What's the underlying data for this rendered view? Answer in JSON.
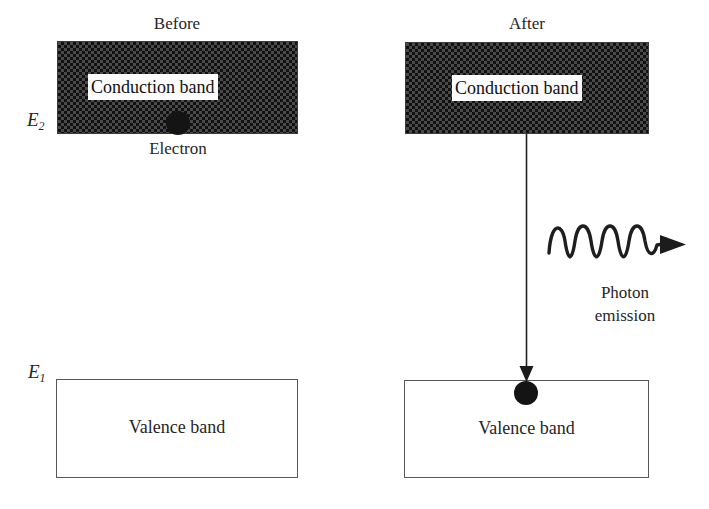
{
  "figure": {
    "topic": "Photon emission from electron transition between conduction and valence band",
    "panels": [
      {
        "id": "before",
        "title": "Before",
        "conduction_band_label": "Conduction band",
        "valence_band_label": "Valence band",
        "energy_label": "E",
        "energy_subscript": "2",
        "electron_caption": "Electron"
      },
      {
        "id": "after",
        "title": "After",
        "conduction_band_label": "Conduction band",
        "valence_band_label": "Valence band",
        "energy_label": "E",
        "energy_subscript": "1",
        "photon_caption_line1": "Photon",
        "photon_caption_line2": "emission"
      }
    ]
  },
  "labels": {
    "title_before": "Before",
    "title_after": "After",
    "conduction_band_before": "Conduction band",
    "conduction_band_after": "Conduction band",
    "valence_band_before": "Valence band",
    "valence_band_after": "Valence band",
    "electron": "Electron",
    "photon_line1": "Photon",
    "photon_line2": "emission",
    "energy_upper_base": "E",
    "energy_upper_sub": "2",
    "energy_lower_base": "E",
    "energy_lower_sub": "1"
  },
  "colors": {
    "background": "#ffffff",
    "ink": "#262626",
    "band_fill_dark": "#111111",
    "band_fill_light": "#c8c8c8",
    "outline": "#585858",
    "electron": "#141414",
    "label_plate": "#fbfbfb"
  },
  "geometry": {
    "canvas_width": 709,
    "canvas_height": 509,
    "conduction_band_before": {
      "x": 57,
      "y": 41,
      "w": 241,
      "h": 93
    },
    "conduction_band_after": {
      "x": 405,
      "y": 42,
      "w": 244,
      "h": 92
    },
    "valence_band_before": {
      "x": 56,
      "y": 379,
      "w": 242,
      "h": 99
    },
    "valence_band_after": {
      "x": 404,
      "y": 380,
      "w": 245,
      "h": 98
    },
    "electron_before": {
      "cx": 178,
      "cy": 123,
      "r": 12
    },
    "electron_after": {
      "cx": 526,
      "cy": 393,
      "r": 12
    },
    "transition_arrow": {
      "x": 526,
      "y_start": 134,
      "y_end": 380
    },
    "photon_wave": {
      "x_start": 548,
      "x_end": 686,
      "y_center": 241,
      "amplitude": 16,
      "cycles": 4
    }
  },
  "icons": {
    "transition_arrow": "down-arrow-icon",
    "photon_wave": "wavy-arrow-icon",
    "electron_dot": "electron-dot-icon"
  }
}
